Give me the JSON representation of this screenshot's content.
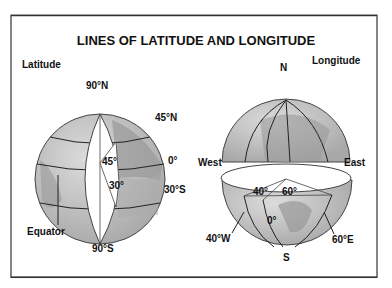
{
  "title": "LINES OF LATITUDE AND LONGITUDE",
  "latitude": {
    "heading": "Latitude",
    "labels": {
      "north_pole": "90°N",
      "lat45n": "45°N",
      "equator_deg": "0°",
      "lat30s": "30°S",
      "south_pole": "90°S",
      "angle45": "45°",
      "angle30": "30°",
      "equator": "Equator"
    }
  },
  "longitude": {
    "heading": "Longitude",
    "labels": {
      "north": "N",
      "south": "S",
      "west": "West",
      "east": "East",
      "angle40": "40°",
      "angle60": "60°",
      "prime": "0°",
      "lon40w": "40°W",
      "lon60e": "60°E"
    }
  },
  "colors": {
    "ocean": "#c9c9c9",
    "land": "#9a9a9a",
    "line": "#222222",
    "frame": "#333333"
  }
}
